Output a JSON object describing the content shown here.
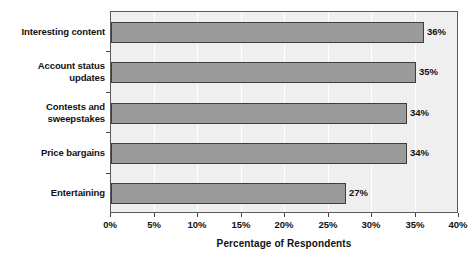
{
  "chart_data": {
    "type": "bar",
    "orientation": "horizontal",
    "title": "",
    "xlabel": "Percentage of Respondents",
    "ylabel": "",
    "categories": [
      "Interesting content",
      "Account status updates",
      "Contests and sweepstakes",
      "Price bargains",
      "Entertaining"
    ],
    "values": [
      36,
      35,
      34,
      34,
      27
    ],
    "data_labels": [
      "36%",
      "35%",
      "34%",
      "34%",
      "27%"
    ],
    "xlim": [
      0,
      40
    ],
    "xticks": [
      0,
      5,
      10,
      15,
      20,
      25,
      30,
      35,
      40
    ],
    "xtick_labels": [
      "0%",
      "5%",
      "10%",
      "15%",
      "20%",
      "25%",
      "30%",
      "35%",
      "40%"
    ],
    "grid": "vertical",
    "legend": "none",
    "colors": {
      "bar_fill": "#9b9b9b",
      "bar_stroke": "#3d3d3d",
      "plot_background": "#efefef",
      "gridline": "#ffffff",
      "plot_border": "#5a5a5a",
      "text": "#111111",
      "page_background": "#ffffff"
    }
  },
  "category_lines": [
    [
      "Interesting content"
    ],
    [
      "Account status",
      "updates"
    ],
    [
      "Contests and",
      "sweepstakes"
    ],
    [
      "Price bargains"
    ],
    [
      "Entertaining"
    ]
  ]
}
